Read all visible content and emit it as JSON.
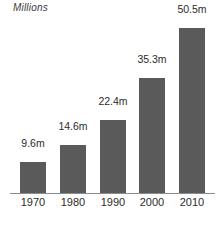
{
  "chart_data": {
    "type": "bar",
    "title": "Millions",
    "subtitle": "",
    "xlabel": "",
    "ylabel": "Millions",
    "categories": [
      "1970",
      "1980",
      "1990",
      "2000",
      "2010"
    ],
    "values": [
      9.6,
      14.6,
      22.4,
      35.3,
      50.5
    ],
    "data_labels": [
      "9.6m",
      "14.6m",
      "22.4m",
      "35.3m",
      "50.5m"
    ],
    "series": [
      {
        "name": "Population",
        "values": [
          9.6,
          14.6,
          22.4,
          35.3,
          50.5
        ]
      }
    ],
    "ylim": [
      0,
      50.5
    ],
    "grid": false,
    "legend": false,
    "legend_position": "none",
    "bar_color": "#5a5a5a",
    "axis_color": "#8c8c8c",
    "background_color": "#ffffff",
    "text_color": "#2b2b2b"
  },
  "axis_title": "Millions",
  "bars": [
    {
      "label": "9.6m",
      "category": "1970",
      "value": 9.6
    },
    {
      "label": "14.6m",
      "category": "1980",
      "value": 14.6
    },
    {
      "label": "22.4m",
      "category": "1990",
      "value": 22.4
    },
    {
      "label": "35.3m",
      "category": "2000",
      "value": 35.3
    },
    {
      "label": "50.5m",
      "category": "2010",
      "value": 50.5
    }
  ]
}
